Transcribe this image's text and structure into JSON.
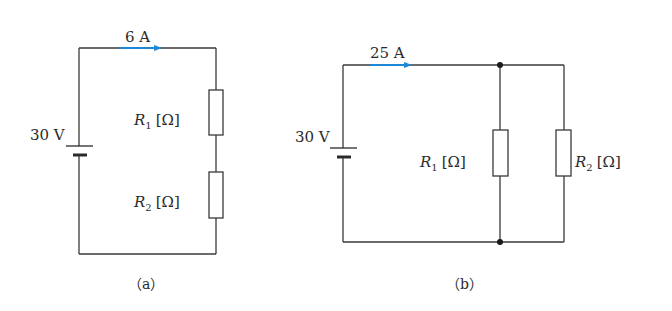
{
  "colors": {
    "wire": "#3a3a3a",
    "current_arrow": "#1e88d8",
    "text": "#2b2b2b",
    "background": "#ffffff"
  },
  "circuit_a": {
    "caption": "（a）",
    "caption_letter": "a",
    "type": "series",
    "source_voltage": "30 V",
    "current": "6 A",
    "resistors": [
      {
        "symbol": "R",
        "subscript": "1",
        "unit": "[Ω]"
      },
      {
        "symbol": "R",
        "subscript": "2",
        "unit": "[Ω]"
      }
    ]
  },
  "circuit_b": {
    "caption": "（b）",
    "caption_letter": "b",
    "type": "parallel",
    "source_voltage": "30 V",
    "current": "25 A",
    "resistors": [
      {
        "symbol": "R",
        "subscript": "1",
        "unit": "[Ω]"
      },
      {
        "symbol": "R",
        "subscript": "2",
        "unit": "[Ω]"
      }
    ]
  }
}
